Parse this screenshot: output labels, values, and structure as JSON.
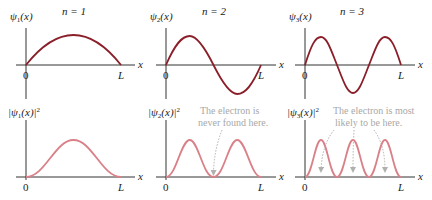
{
  "panels": [
    {
      "n_label": "n = 1",
      "psi_label": "ψ",
      "psi_sub": "1",
      "psi_arg": "(x)",
      "prob_label_pre": "|ψ",
      "prob_sub": "1",
      "prob_label_post": "(x)|",
      "prob_sup": "2",
      "origin": "0",
      "end": "L",
      "axis": "x"
    },
    {
      "n_label": "n = 2",
      "psi_label": "ψ",
      "psi_sub": "2",
      "psi_arg": "(x)",
      "prob_label_pre": "|ψ",
      "prob_sub": "2",
      "prob_label_post": "(x)|",
      "prob_sup": "2",
      "origin": "0",
      "end": "L",
      "axis": "x"
    },
    {
      "n_label": "n = 3",
      "psi_label": "ψ",
      "psi_sub": "3",
      "psi_arg": "(x)",
      "prob_label_pre": "|ψ",
      "prob_sub": "3",
      "prob_label_post": "(x)|",
      "prob_sup": "2",
      "origin": "0",
      "end": "L",
      "axis": "x"
    }
  ],
  "annotations": {
    "node_line1": "The electron is",
    "node_line2": "never found here.",
    "peak_line1": "The electron is most",
    "peak_line2": "likely to be here."
  },
  "colors": {
    "wave": "#8a1f2a",
    "prob": "#d98088",
    "axis": "#333333",
    "note": "#a8a8a8"
  }
}
